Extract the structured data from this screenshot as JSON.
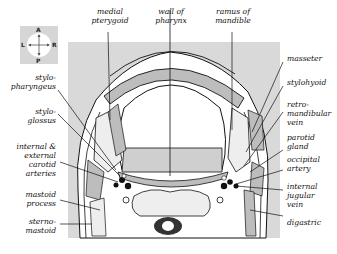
{
  "figure": {
    "orientation": {
      "anterior": "A",
      "posterior": "P",
      "left": "L",
      "right": "R"
    },
    "labels_top": [
      {
        "id": "medial-pterygoid",
        "text": "medial\npterygoid"
      },
      {
        "id": "wall-of-pharynx",
        "text": "wall of\npharynx"
      },
      {
        "id": "ramus-of-mandible",
        "text": "ramus of\nmandible"
      }
    ],
    "labels_left": [
      {
        "id": "stylopharyngeus",
        "text": "stylo-\npharyngeus"
      },
      {
        "id": "styloglossus",
        "text": "stylo-\nglossus"
      },
      {
        "id": "carotid-arteries",
        "text": "internal &\nexternal\ncarotid\narteries"
      },
      {
        "id": "mastoid-process",
        "text": "mastoid\nprocess"
      },
      {
        "id": "sternomastoid",
        "text": "sterno-\nmastoid"
      }
    ],
    "labels_right": [
      {
        "id": "masseter",
        "text": "masseter"
      },
      {
        "id": "stylohyoid",
        "text": "stylohyoid"
      },
      {
        "id": "retromandibular-vein",
        "text": "retro-\nmandibular\nvein"
      },
      {
        "id": "parotid-gland",
        "text": "parotid\ngland"
      },
      {
        "id": "occipital-artery",
        "text": "occipital\nartery"
      },
      {
        "id": "internal-jugular-vein",
        "text": "internal\njugular\nvein"
      },
      {
        "id": "digastric",
        "text": "digastric"
      }
    ],
    "colors": {
      "background_box": "#d9d9d9",
      "muscle": "#bdbdbd",
      "stipple": "#e8e8e8",
      "line": "#111111"
    }
  }
}
